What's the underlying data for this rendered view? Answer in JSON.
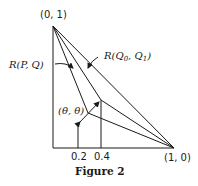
{
  "figure": {
    "caption": "Figure 2",
    "vertices": {
      "top": "(0, 1)",
      "right": "(1, 0)"
    },
    "labels": {
      "r_pq": "R(P, Q)",
      "r_q0q1": "R(Q",
      "r_q0q1_sub0": "0",
      "r_q0q1_mid": ", Q",
      "r_q0q1_sub1": "1",
      "r_q0q1_end": ")",
      "theta": "(θ, θ)"
    },
    "ticks": [
      "0.2",
      "0.4"
    ]
  },
  "colors": {
    "ink": "#1a1a1a",
    "background": "#ffffff"
  }
}
